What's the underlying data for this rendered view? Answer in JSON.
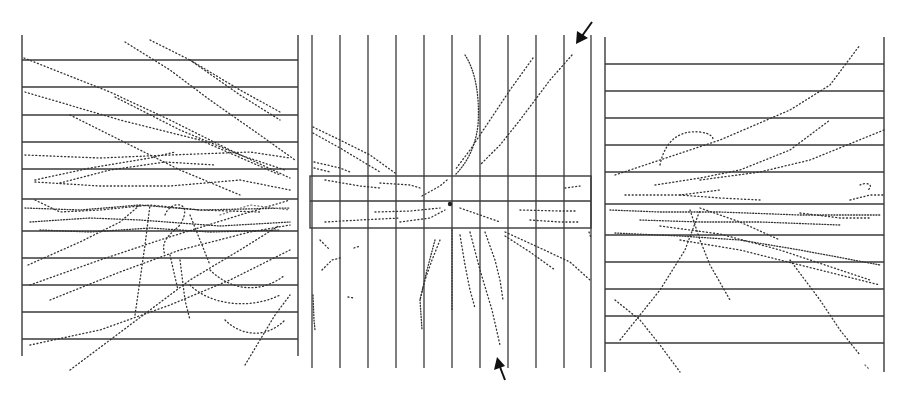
{
  "figure": {
    "colors": {
      "background": "#ffffff",
      "lines": "#3a3a3a",
      "tracks": "#333333",
      "arrows": "#111111"
    },
    "panels": [
      {
        "id": "left-view",
        "frame": {
          "x1": 22,
          "y1": 35,
          "x2": 298,
          "y2": 356
        },
        "orientation": "horizontal-plates",
        "plate_y": [
          60,
          87,
          115,
          142,
          169,
          199,
          231,
          258,
          285,
          312,
          339
        ]
      },
      {
        "id": "center-view",
        "frame": {
          "x1": 312,
          "y1": 35,
          "x2": 591,
          "y2": 368
        },
        "orientation": "vertical-plates",
        "plate_x": [
          312,
          340,
          368,
          396,
          424,
          452,
          480,
          508,
          536,
          564,
          591
        ],
        "target_box": {
          "x1": 310,
          "y1": 176,
          "x2": 591,
          "y2": 228,
          "divider_y": 201
        },
        "vertex": {
          "x": 450,
          "y": 204
        },
        "arrows": [
          {
            "id": "upper-arrow",
            "tail": [
              592,
              22
            ],
            "head": [
              576,
              44
            ]
          },
          {
            "id": "lower-arrow",
            "tail": [
              505,
              380
            ],
            "head": [
              497,
              358
            ]
          }
        ]
      },
      {
        "id": "right-view",
        "frame": {
          "x1": 605,
          "y1": 37,
          "x2": 884,
          "y2": 372
        },
        "orientation": "horizontal-plates",
        "plate_y": [
          64,
          91,
          118,
          145,
          172,
          204,
          235,
          262,
          289,
          316,
          343
        ]
      }
    ]
  }
}
